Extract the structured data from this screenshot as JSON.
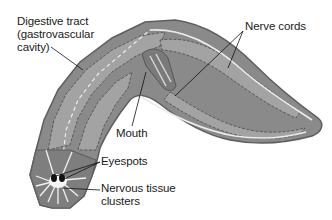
{
  "diagram": {
    "colors": {
      "body_fill": "#8a8a8a",
      "body_edge": "#5e5e5e",
      "gut_fill": "#a9a9a9",
      "gut_outline": "#4a4a4a",
      "nerve_cord": "#e8e8e8",
      "leader_line": "#111111",
      "text": "#1a1a1a"
    },
    "labels": {
      "digestive_tract": "Digestive tract\n(gastrovascular\ncavity)",
      "nerve_cords": "Nerve cords",
      "mouth": "Mouth",
      "eyespots": "Eyespots",
      "nervous_tissue": "Nervous tissue\nclusters"
    }
  }
}
